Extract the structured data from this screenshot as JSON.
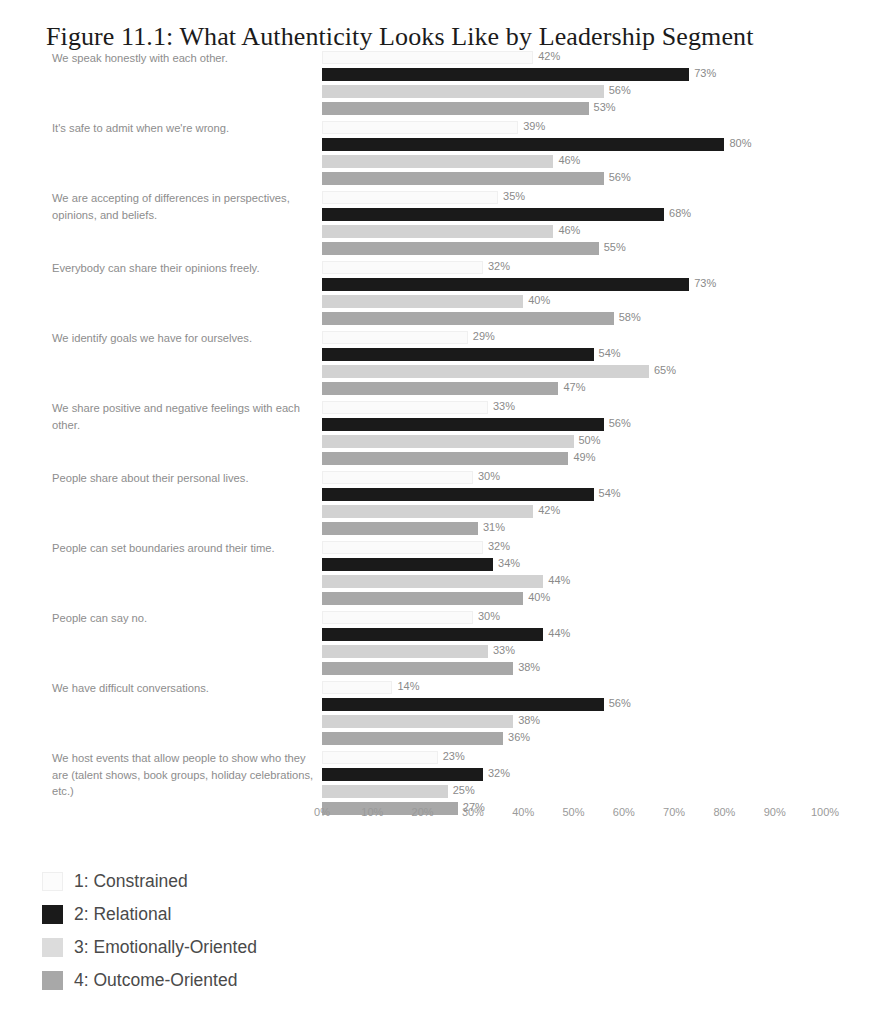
{
  "title": "Figure 11.1: What Authenticity Looks Like by Leadership Segment",
  "axis": {
    "ticks": [
      "0%",
      "10%",
      "20%",
      "30%",
      "40%",
      "50%",
      "60%",
      "70%",
      "80%",
      "90%",
      "100%"
    ]
  },
  "legend": {
    "items": [
      {
        "label": "1: Constrained",
        "color": "#fcfcfc"
      },
      {
        "label": "2: Relational",
        "color": "#1a1a1a"
      },
      {
        "label": "3: Emotionally-Oriented",
        "color": "#dcdcdc"
      },
      {
        "label": "4: Outcome-Oriented",
        "color": "#a8a8a8"
      }
    ]
  },
  "chart_data": {
    "type": "bar",
    "orientation": "horizontal",
    "title": "Figure 11.1: What Authenticity Looks Like by Leadership Segment",
    "xlabel": "",
    "ylabel": "",
    "xlim": [
      0,
      100
    ],
    "grid": false,
    "legend_position": "bottom-left",
    "value_suffix": "%",
    "categories": [
      "We speak honestly with each other.",
      "It's safe to admit when we're wrong.",
      "We are accepting of differences in perspectives, opinions, and beliefs.",
      "Everybody can share their opinions freely.",
      "We identify goals we have for ourselves.",
      "We share positive and negative feelings with each other.",
      "People share about their personal lives.",
      "People can set boundaries around their time.",
      "People can say no.",
      "We have difficult conversations.",
      "We host events that allow people to show who they are (talent shows, book groups, holiday celebrations, etc.)"
    ],
    "series": [
      {
        "name": "1: Constrained",
        "color": "#fcfcfc",
        "values": [
          42,
          39,
          35,
          32,
          29,
          33,
          30,
          32,
          30,
          14,
          23
        ]
      },
      {
        "name": "2: Relational",
        "color": "#1a1a1a",
        "values": [
          73,
          80,
          68,
          73,
          54,
          56,
          54,
          34,
          44,
          56,
          32
        ]
      },
      {
        "name": "3: Emotionally-Oriented",
        "color": "#dcdcdc",
        "values": [
          56,
          46,
          46,
          40,
          65,
          50,
          42,
          44,
          33,
          38,
          25
        ]
      },
      {
        "name": "4: Outcome-Oriented",
        "color": "#a8a8a8",
        "values": [
          53,
          56,
          55,
          58,
          47,
          49,
          31,
          40,
          38,
          36,
          27
        ]
      }
    ]
  }
}
